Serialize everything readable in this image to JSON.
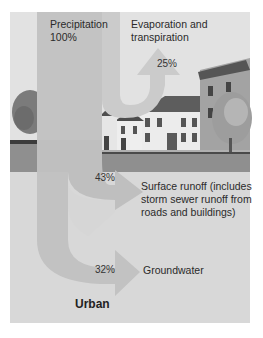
{
  "diagram": {
    "title": "Urban",
    "flows": {
      "precipitation": {
        "label": "Precipitation",
        "percent": "100%"
      },
      "evaporation": {
        "label_line1": "Evaporation and",
        "label_line2": "transpiration",
        "percent": "25%"
      },
      "surface_runoff": {
        "label_line1": "Surface runoff (includes",
        "label_line2": "storm sewer runoff from",
        "label_line3": "roads and buildings)",
        "percent": "43%"
      },
      "groundwater": {
        "label": "Groundwater",
        "percent": "32%"
      }
    },
    "colors": {
      "panel": "#d9d9d9",
      "sky": "#e4e4e4",
      "arrow_main": "#c0c0c0",
      "arrow_light": "#cfcfcf",
      "ground": "#8e8e8e",
      "building_wall": "#eaeaea",
      "building_roof": "#5a5a5a",
      "tree": "#7a7a7a"
    }
  }
}
